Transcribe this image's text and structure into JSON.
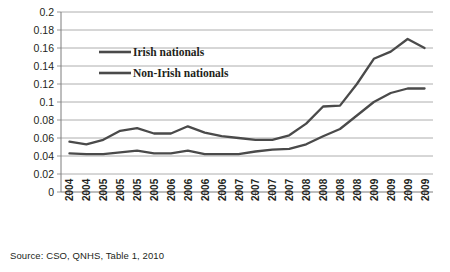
{
  "chart_data": {
    "type": "line",
    "title": "",
    "xlabel": "",
    "ylabel": "",
    "ylim": [
      0,
      0.2
    ],
    "ytick_values": [
      0,
      0.02,
      0.04,
      0.06,
      0.08,
      0.1,
      0.12,
      0.14,
      0.16,
      0.18,
      0.2
    ],
    "ytick_labels": [
      "0",
      "0.02",
      "0.04",
      "0.06",
      "0.08",
      "0.1",
      "0.12",
      "0.14",
      "0.16",
      "0.18",
      "0.2"
    ],
    "grid": true,
    "legend_position": "upper-left-inside",
    "categories": [
      "2004",
      "2004",
      "2005",
      "2005",
      "2005",
      "2005",
      "2006",
      "2006",
      "2006",
      "2006",
      "2007",
      "2007",
      "2007",
      "2007",
      "2008",
      "2008",
      "2008",
      "2008",
      "2009",
      "2009",
      "2009",
      "2009"
    ],
    "series": [
      {
        "name": "Non-Irish nationals",
        "values": [
          0.056,
          0.053,
          0.058,
          0.068,
          0.071,
          0.065,
          0.065,
          0.073,
          0.066,
          0.062,
          0.06,
          0.058,
          0.058,
          0.063,
          0.076,
          0.095,
          0.096,
          0.12,
          0.148,
          0.156,
          0.17,
          0.16
        ]
      },
      {
        "name": "Irish nationals",
        "values": [
          0.043,
          0.042,
          0.042,
          0.044,
          0.046,
          0.043,
          0.043,
          0.046,
          0.042,
          0.042,
          0.042,
          0.045,
          0.047,
          0.048,
          0.053,
          0.062,
          0.07,
          0.085,
          0.1,
          0.11,
          0.115,
          0.115
        ]
      }
    ],
    "legend_entries": [
      "Irish nationals",
      "Non-Irish nationals"
    ]
  },
  "source": {
    "text": "Source: CSO, QNHS, Table 1, 2010"
  }
}
